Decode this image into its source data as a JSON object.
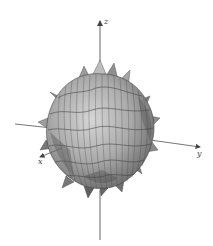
{
  "figure": {
    "axes": {
      "x_label": "x",
      "y_label": "y",
      "z_label": "z"
    },
    "colors": {
      "background": "#ffffff",
      "axis": "#555555",
      "surface_light": "#c8c8c8",
      "surface_mid": "#a8a8a8",
      "surface_dark": "#6e6e6e",
      "mesh": "#3a3a3a"
    }
  }
}
